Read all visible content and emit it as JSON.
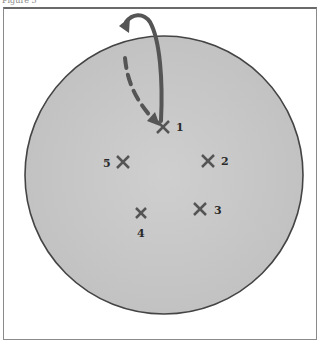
{
  "figure": {
    "label": "Figure 5"
  },
  "diagram": {
    "dish": {
      "cx": 164,
      "cy": 175,
      "r": 139,
      "fill": "#c9c9c9",
      "stroke": "#444444"
    },
    "marks": [
      {
        "id": "1",
        "x": 163,
        "y": 127,
        "label": "1",
        "lx": 176,
        "ly": 131
      },
      {
        "id": "2",
        "x": 208,
        "y": 161,
        "label": "2",
        "lx": 221,
        "ly": 165
      },
      {
        "id": "3",
        "x": 200,
        "y": 209,
        "label": "3",
        "lx": 214,
        "ly": 214
      },
      {
        "id": "4",
        "x": 141,
        "y": 213,
        "label": "4",
        "lx": 137,
        "ly": 237
      },
      {
        "id": "5",
        "x": 123,
        "y": 162,
        "label": "5",
        "lx": 103,
        "ly": 167
      }
    ],
    "arrows": {
      "solid_curve": "from mark 1 arching up and left outside the dish",
      "dashed_line": "from near top of dish down to mark 1"
    }
  }
}
